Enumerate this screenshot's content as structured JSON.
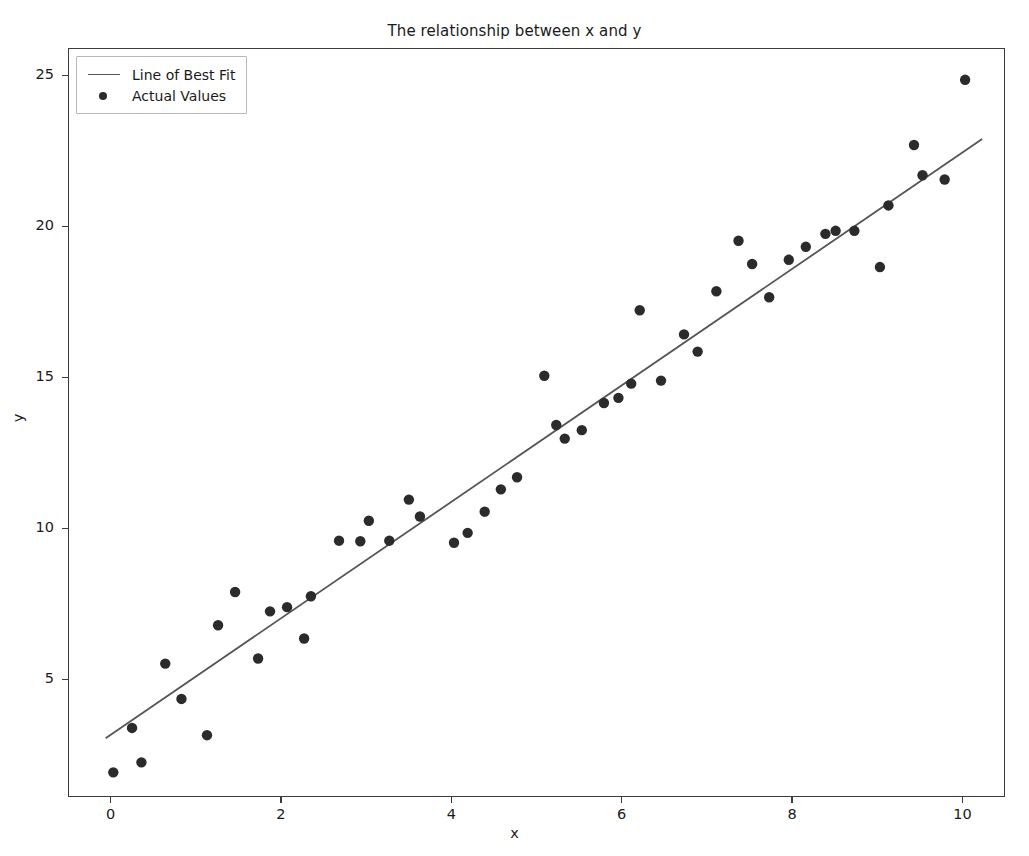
{
  "chart_data": {
    "type": "scatter",
    "title": "The relationship between x and y",
    "xlabel": "x",
    "ylabel": "y",
    "xlim": [
      -0.5,
      10.5
    ],
    "ylim": [
      1.1,
      25.9
    ],
    "xticks": [
      0,
      2,
      4,
      6,
      8,
      10
    ],
    "yticks": [
      5,
      10,
      15,
      20,
      25
    ],
    "grid": false,
    "legend_position": "upper left",
    "series": [
      {
        "name": "Line of Best Fit",
        "type": "line",
        "color": "#555555",
        "x": [
          -0.07,
          10.22
        ],
        "y": [
          3.08,
          22.92
        ],
        "slope": 1.929,
        "intercept": 3.215
      },
      {
        "name": "Actual Values",
        "type": "scatter",
        "color": "#2b2b2b",
        "marker": "o",
        "points": [
          [
            0.02,
            1.95
          ],
          [
            0.24,
            3.42
          ],
          [
            0.35,
            2.28
          ],
          [
            0.63,
            5.55
          ],
          [
            0.82,
            4.38
          ],
          [
            1.12,
            3.18
          ],
          [
            1.25,
            6.82
          ],
          [
            1.45,
            7.92
          ],
          [
            1.72,
            5.72
          ],
          [
            1.86,
            7.28
          ],
          [
            2.06,
            7.42
          ],
          [
            2.26,
            6.38
          ],
          [
            2.34,
            7.78
          ],
          [
            2.67,
            9.62
          ],
          [
            2.92,
            9.6
          ],
          [
            3.02,
            10.28
          ],
          [
            3.26,
            9.62
          ],
          [
            3.49,
            10.98
          ],
          [
            3.62,
            10.42
          ],
          [
            4.02,
            9.55
          ],
          [
            4.18,
            9.88
          ],
          [
            4.38,
            10.58
          ],
          [
            4.57,
            11.32
          ],
          [
            4.76,
            11.72
          ],
          [
            5.08,
            15.08
          ],
          [
            5.32,
            13.0
          ],
          [
            5.22,
            13.45
          ],
          [
            5.52,
            13.28
          ],
          [
            5.78,
            14.18
          ],
          [
            5.95,
            14.35
          ],
          [
            6.1,
            14.82
          ],
          [
            6.2,
            17.25
          ],
          [
            6.45,
            14.92
          ],
          [
            6.72,
            16.45
          ],
          [
            6.88,
            15.88
          ],
          [
            7.1,
            17.88
          ],
          [
            7.36,
            19.55
          ],
          [
            7.52,
            18.78
          ],
          [
            7.72,
            17.68
          ],
          [
            7.95,
            18.92
          ],
          [
            8.15,
            19.35
          ],
          [
            8.38,
            19.78
          ],
          [
            8.5,
            19.88
          ],
          [
            8.72,
            19.88
          ],
          [
            9.02,
            18.68
          ],
          [
            9.12,
            20.72
          ],
          [
            9.42,
            22.72
          ],
          [
            9.52,
            21.72
          ],
          [
            9.78,
            21.58
          ],
          [
            10.02,
            24.88
          ]
        ]
      }
    ]
  },
  "legend": {
    "entries": [
      {
        "label": "Line of Best Fit",
        "key": "line-key"
      },
      {
        "label": "Actual Values",
        "key": "dot-key"
      }
    ]
  },
  "colors": {
    "marker": "#2b2b2b",
    "fit_line": "#555555",
    "axis": "#3b3b3b",
    "background": "#ffffff"
  }
}
